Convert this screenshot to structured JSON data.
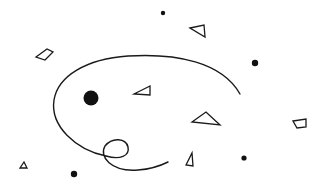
{
  "canvas": {
    "width": 327,
    "height": 190,
    "background": "#ffffff",
    "ink": "#111111"
  },
  "curve": {
    "name": "spiral-loop-curve",
    "path": "M240,94 C222,62 176,53 128,56 C86,59 58,76 54,100 C50,126 76,150 106,156 C120,160 130,156 128,147 C126,138 112,137 105,146 C99,156 110,172 138,170 C152,169 162,165 168,162"
  },
  "dots": [
    {
      "name": "large-dot",
      "cx": 91,
      "cy": 98,
      "r": 7.5
    },
    {
      "name": "dot-top",
      "cx": 163,
      "cy": 13,
      "r": 2.2
    },
    {
      "name": "dot-right",
      "cx": 255,
      "cy": 63,
      "r": 3.2
    },
    {
      "name": "dot-bottom-left",
      "cx": 74,
      "cy": 174,
      "r": 3.2
    },
    {
      "name": "dot-bottom-right",
      "cx": 244,
      "cy": 158,
      "r": 2.6
    }
  ],
  "shapes": [
    {
      "name": "quad-top-left",
      "points": "36,57 47,49 53,52 45,60"
    },
    {
      "name": "triangle-top-right",
      "points": "190,28 204,25 205,37"
    },
    {
      "name": "triangle-center",
      "points": "134,94 150,86 150,95"
    },
    {
      "name": "triangle-right-large",
      "points": "192,122 206,112 220,125"
    },
    {
      "name": "quad-right",
      "points": "293,121 306,119 306,127 297,128"
    },
    {
      "name": "triangle-bottom-center",
      "points": "186,165 192,153 193,166"
    },
    {
      "name": "triangle-bottom-left",
      "points": "20,168 24,162 27,168"
    }
  ]
}
